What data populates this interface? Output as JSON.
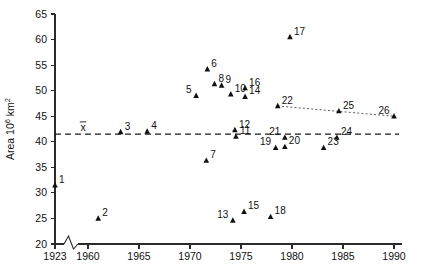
{
  "chart_data": {
    "type": "scatter",
    "title": "",
    "subtitle": "",
    "xlabel": "",
    "ylabel": "Area 10⁶ km²",
    "ylabel_parts": {
      "prefix": "Area 10",
      "exponent": "6",
      "suffix": " km",
      "suffix_exponent": "2"
    },
    "xlim": [
      1923,
      1990.8
    ],
    "ylim": [
      20,
      65
    ],
    "x_ticks": [
      "1923",
      "1960",
      "1965",
      "1970",
      "1975",
      "1980",
      "1985",
      "1990"
    ],
    "x_tick_values": [
      1923,
      1960,
      1965,
      1970,
      1975,
      1980,
      1985,
      1990
    ],
    "y_ticks": [
      "20",
      "25",
      "30",
      "35",
      "40",
      "45",
      "50",
      "55",
      "60",
      "65"
    ],
    "y_tick_values": [
      20,
      25,
      30,
      35,
      40,
      45,
      50,
      55,
      60,
      65
    ],
    "axis_break": {
      "present": true,
      "axis": "x",
      "after_value": 1923,
      "style": "zigzag"
    },
    "grid": false,
    "legend": null,
    "mean_line": {
      "label": "x̄",
      "label_text": "x",
      "value": 41.5,
      "style": "dashed",
      "x_start": 1923,
      "x_end": 1990.5
    },
    "trend_line": {
      "style": "dotted",
      "points": [
        {
          "x": 1978.6,
          "y": 47.0
        },
        {
          "x": 1990.0,
          "y": 45.0
        }
      ]
    },
    "series": [
      {
        "name": "Sea ice extent observations",
        "marker": "triangle",
        "points": [
          {
            "label": "1",
            "x": 1923.0,
            "y": 31.5,
            "label_pos": "right"
          },
          {
            "label": "2",
            "x": 1961.0,
            "y": 25.0,
            "label_pos": "right"
          },
          {
            "label": "3",
            "x": 1963.2,
            "y": 41.9,
            "label_pos": "right"
          },
          {
            "label": "4",
            "x": 1965.8,
            "y": 42.0,
            "label_pos": "right"
          },
          {
            "label": "5",
            "x": 1970.6,
            "y": 49.0,
            "label_pos": "left"
          },
          {
            "label": "6",
            "x": 1971.7,
            "y": 54.2,
            "label_pos": "right"
          },
          {
            "label": "7",
            "x": 1971.6,
            "y": 36.3,
            "label_pos": "right"
          },
          {
            "label": "8",
            "x": 1972.4,
            "y": 51.3,
            "label_pos": "right"
          },
          {
            "label": "9",
            "x": 1973.1,
            "y": 51.0,
            "label_pos": "right"
          },
          {
            "label": "10",
            "x": 1974.0,
            "y": 49.3,
            "label_pos": "right"
          },
          {
            "label": "11",
            "x": 1974.5,
            "y": 41.0,
            "label_pos": "right"
          },
          {
            "label": "12",
            "x": 1974.4,
            "y": 42.3,
            "label_pos": "right"
          },
          {
            "label": "13",
            "x": 1974.2,
            "y": 24.6,
            "label_pos": "left"
          },
          {
            "label": "14",
            "x": 1975.4,
            "y": 48.8,
            "label_pos": "right"
          },
          {
            "label": "15",
            "x": 1975.3,
            "y": 26.3,
            "label_pos": "right"
          },
          {
            "label": "16",
            "x": 1975.4,
            "y": 50.5,
            "label_pos": "right"
          },
          {
            "label": "17",
            "x": 1979.8,
            "y": 60.5,
            "label_pos": "right"
          },
          {
            "label": "18",
            "x": 1977.9,
            "y": 25.3,
            "label_pos": "right"
          },
          {
            "label": "19",
            "x": 1978.4,
            "y": 38.8,
            "label_pos": "left"
          },
          {
            "label": "20",
            "x": 1979.3,
            "y": 39.0,
            "label_pos": "right"
          },
          {
            "label": "21",
            "x": 1979.3,
            "y": 40.8,
            "label_pos": "left"
          },
          {
            "label": "22",
            "x": 1978.6,
            "y": 47.0,
            "label_pos": "right"
          },
          {
            "label": "23",
            "x": 1983.1,
            "y": 38.8,
            "label_pos": "right"
          },
          {
            "label": "24",
            "x": 1984.4,
            "y": 40.8,
            "label_pos": "right"
          },
          {
            "label": "25",
            "x": 1984.6,
            "y": 46.0,
            "label_pos": "right"
          },
          {
            "label": "26",
            "x": 1990.0,
            "y": 45.0,
            "label_pos": "left"
          }
        ]
      }
    ]
  },
  "colors": {
    "marker": "#111111",
    "axis": "#2b2b2b",
    "mean_line": "#1b1b1b",
    "trend_line": "#4a4a4a",
    "background": "#ffffff"
  }
}
